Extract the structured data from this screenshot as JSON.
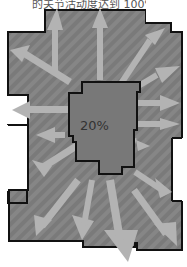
{
  "caption": "的关节活动度达到 100%",
  "center_label": "20%",
  "colors": {
    "outer_fill": "#7a7a7a",
    "stripe": "#888888",
    "inner_fill": "#777777",
    "arrow": "#b3b3b3",
    "outline": "#111111"
  }
}
